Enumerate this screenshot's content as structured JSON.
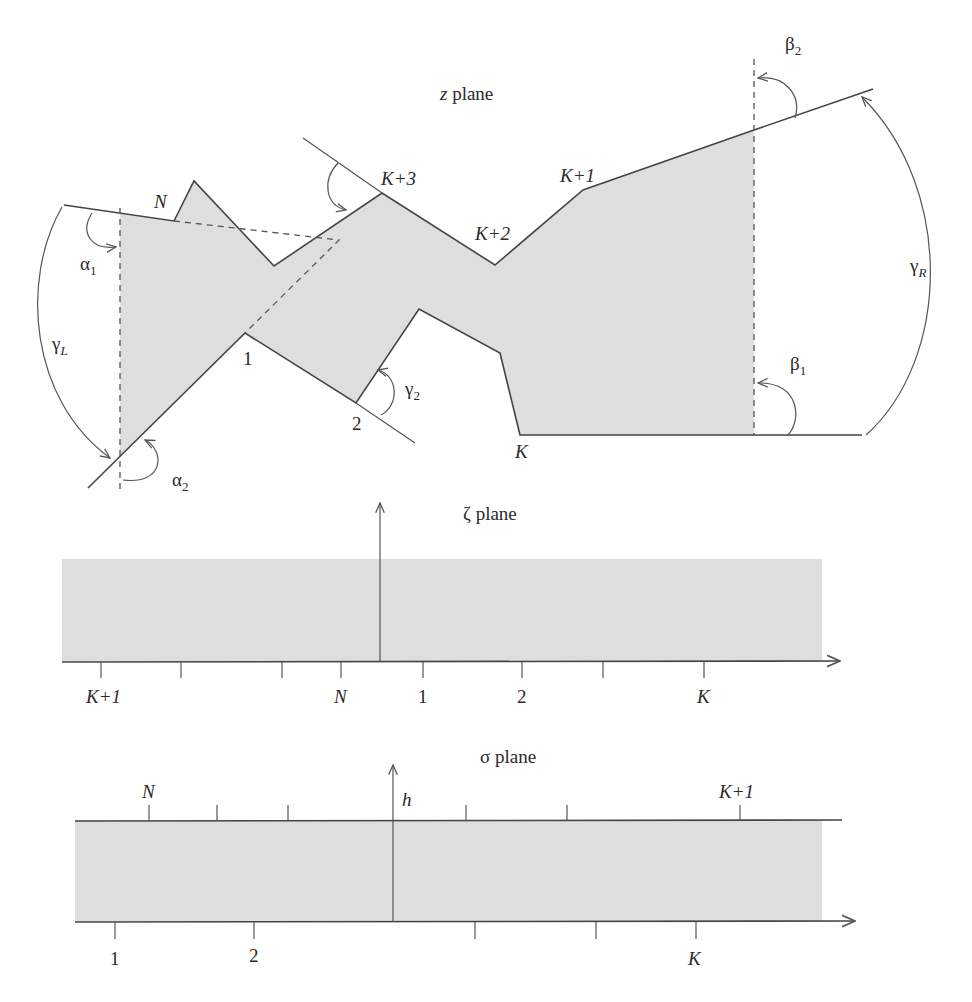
{
  "figure": {
    "panels": [
      {
        "id": "z",
        "title_var": "z",
        "title_word": "plane",
        "vertex_labels": [
          "N",
          "K+3",
          "K+2",
          "K+1",
          "1",
          "2",
          "K"
        ],
        "angle_labels": {
          "alpha1": {
            "base": "α",
            "sub": "1"
          },
          "alpha2": {
            "base": "α",
            "sub": "2"
          },
          "beta1": {
            "base": "β",
            "sub": "1"
          },
          "beta2": {
            "base": "β",
            "sub": "2"
          },
          "gamma2": {
            "base": "γ",
            "sub": "2"
          },
          "gammaL": {
            "base": "γ",
            "sub": "L"
          },
          "gammaR": {
            "base": "γ",
            "sub": "R"
          }
        }
      },
      {
        "id": "zeta",
        "title_var": "ζ",
        "title_word": "plane",
        "axis_tick_labels": [
          "K+1",
          "",
          "",
          "N",
          "1",
          "2",
          "",
          "K"
        ]
      },
      {
        "id": "sigma",
        "title_var": "σ",
        "title_word": "plane",
        "height_label": "h",
        "top_tick_labels": [
          "N",
          "",
          "",
          "",
          "",
          "K+1"
        ],
        "bottom_tick_labels": [
          "1",
          "2",
          "",
          "",
          "K"
        ]
      }
    ],
    "colors": {
      "shade": "#dedede",
      "line": "#444444"
    }
  }
}
